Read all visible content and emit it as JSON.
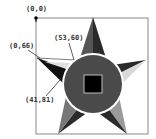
{
  "diagram": {
    "type": "star-coordinate-diagram",
    "labels": {
      "origin": "(0,0)",
      "top_point": "(53,60)",
      "left_point": "(0,66)",
      "bottom_point": "(41,81)"
    },
    "colors": {
      "frame": "#888888",
      "star_dark": "#2a2a2a",
      "star_mid": "#555555",
      "star_light": "#9a9a9a",
      "star_pale": "#d8d8d8",
      "circle_fill": "#4a4a4a",
      "circle_ring": "#ffffff",
      "square_fill": "#000000",
      "square_border": "#bbbbbb",
      "label": "#333333"
    }
  }
}
